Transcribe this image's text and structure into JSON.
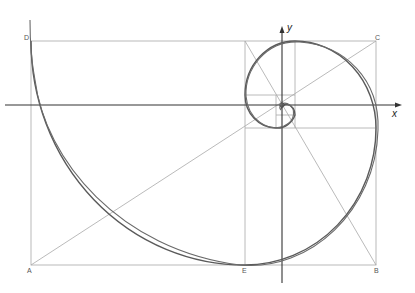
{
  "diagram": {
    "type": "golden-spiral-construction",
    "axes": {
      "x_label": "x",
      "y_label": "y"
    },
    "points": {
      "A": "A",
      "B": "B",
      "C": "C",
      "D": "D",
      "E": "E"
    },
    "colors": {
      "construction": "#9a9a9a",
      "axis": "#333333",
      "spiral": "#555555"
    }
  }
}
